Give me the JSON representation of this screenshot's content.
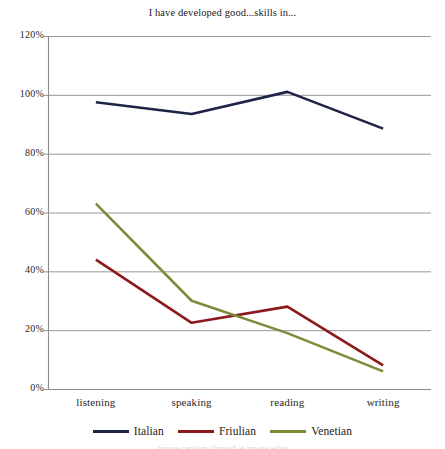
{
  "chart_data": {
    "type": "line",
    "title": "I have developed good...skills in...",
    "xlabel": "",
    "ylabel": "",
    "categories": [
      "listening",
      "speaking",
      "reading",
      "writing"
    ],
    "series": [
      {
        "name": "Italian",
        "color": "#1f2348",
        "values": [
          97.5,
          93.5,
          101,
          88.5
        ]
      },
      {
        "name": "Friulian",
        "color": "#8b1a1a",
        "values": [
          44,
          22.5,
          28,
          8
        ]
      },
      {
        "name": "Venetian",
        "color": "#7b8c3a",
        "values": [
          63,
          30,
          19,
          6
        ]
      }
    ],
    "ylim": [
      0,
      120
    ],
    "ytick_labels": [
      "0%",
      "20%",
      "40%",
      "60%",
      "80%",
      "100%",
      "120%"
    ],
    "ytick_values": [
      0,
      20,
      40,
      60,
      80,
      100,
      120
    ],
    "grid": true,
    "grid_axis": "y",
    "legend_position": "bottom",
    "axis_color": "#8c8c8c",
    "grid_color": "#8c8c8c"
  },
  "caption": "figure caption clipped at image edge"
}
